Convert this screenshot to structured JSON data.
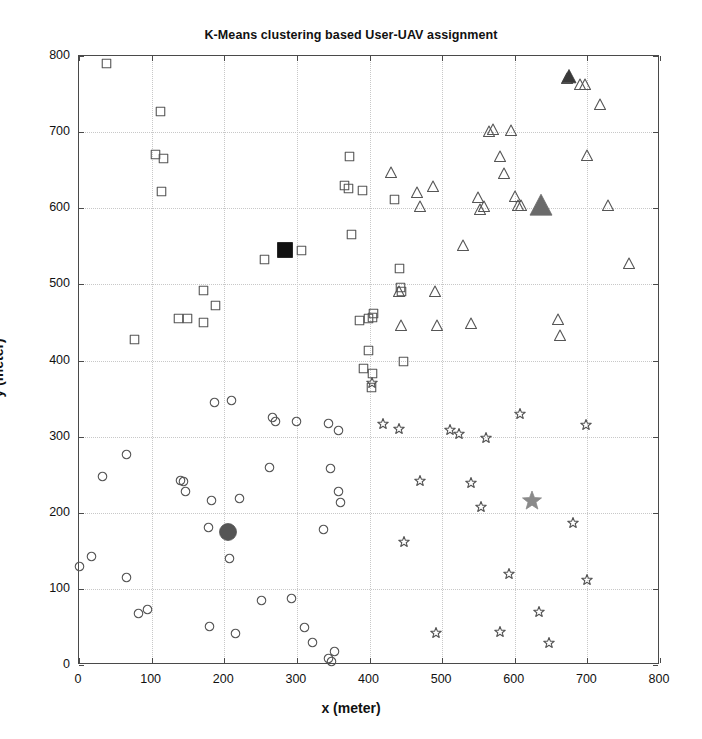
{
  "figure": {
    "title": "K-Means clustering based User-UAV assignment",
    "xlabel": "x (meter)",
    "ylabel": "y (meter)"
  },
  "colors": {
    "axis": "#4a4a4a",
    "grid": "#c8c8c8",
    "marker_outline": "#555555",
    "centroid_square": "#111111",
    "centroid_circle": "#555555",
    "centroid_triangle": "#6a6a6a",
    "centroid_star": "#8a8a8a",
    "centroid_triangle_dark": "#3a3a3a",
    "text": "#111111"
  },
  "chart_data": {
    "type": "scatter",
    "title": "K-Means clustering based User-UAV assignment",
    "xlabel": "x (meter)",
    "ylabel": "y (meter)",
    "xlim": [
      0,
      800
    ],
    "ylim": [
      0,
      800
    ],
    "xticks": [
      0,
      100,
      200,
      300,
      400,
      500,
      600,
      700,
      800
    ],
    "yticks": [
      0,
      100,
      200,
      300,
      400,
      500,
      600,
      700,
      800
    ],
    "grid": true,
    "legend": "none",
    "series": [
      {
        "name": "Cluster 1 users (square)",
        "marker": "square",
        "filled": false,
        "points": [
          [
            38,
            790
          ],
          [
            112,
            727
          ],
          [
            106,
            671
          ],
          [
            117,
            665
          ],
          [
            114,
            622
          ],
          [
            76,
            428
          ],
          [
            137,
            455
          ],
          [
            150,
            455
          ],
          [
            172,
            492
          ],
          [
            171,
            450
          ],
          [
            188,
            472
          ],
          [
            256,
            533
          ],
          [
            283,
            545
          ],
          [
            306,
            545
          ],
          [
            373,
            668
          ],
          [
            365,
            630
          ],
          [
            371,
            626
          ],
          [
            391,
            623
          ],
          [
            375,
            566
          ],
          [
            386,
            453
          ],
          [
            398,
            455
          ],
          [
            404,
            457
          ],
          [
            406,
            462
          ],
          [
            399,
            413
          ],
          [
            392,
            389
          ],
          [
            404,
            383
          ],
          [
            403,
            364
          ],
          [
            435,
            612
          ],
          [
            442,
            496
          ],
          [
            444,
            490
          ],
          [
            441,
            521
          ],
          [
            447,
            399
          ]
        ]
      },
      {
        "name": "Cluster 1 centroid (filled square)",
        "marker": "square",
        "filled": true,
        "size": 15,
        "points": [
          [
            283,
            545
          ]
        ]
      },
      {
        "name": "Cluster 2 users (circle)",
        "marker": "circle",
        "filled": false,
        "points": [
          [
            0,
            130
          ],
          [
            17,
            142
          ],
          [
            33,
            247
          ],
          [
            65,
            276
          ],
          [
            66,
            115
          ],
          [
            82,
            67
          ],
          [
            95,
            73
          ],
          [
            140,
            242
          ],
          [
            144,
            241
          ],
          [
            147,
            228
          ],
          [
            180,
            51
          ],
          [
            178,
            181
          ],
          [
            183,
            216
          ],
          [
            186,
            345
          ],
          [
            207,
            140
          ],
          [
            210,
            348
          ],
          [
            207,
            175
          ],
          [
            216,
            41
          ],
          [
            221,
            219
          ],
          [
            251,
            85
          ],
          [
            262,
            259
          ],
          [
            266,
            325
          ],
          [
            271,
            320
          ],
          [
            292,
            88
          ],
          [
            300,
            320
          ],
          [
            310,
            49
          ],
          [
            322,
            30
          ],
          [
            344,
            9
          ],
          [
            348,
            4
          ],
          [
            352,
            18
          ],
          [
            346,
            258
          ],
          [
            357,
            228
          ],
          [
            360,
            214
          ],
          [
            336,
            178
          ],
          [
            344,
            317
          ],
          [
            358,
            308
          ]
        ]
      },
      {
        "name": "Cluster 2 centroid (filled circle)",
        "marker": "circle",
        "filled": true,
        "size": 17,
        "points": [
          [
            205,
            175
          ]
        ]
      },
      {
        "name": "Cluster 3 users (triangle)",
        "marker": "triangle",
        "filled": false,
        "points": [
          [
            430,
            646
          ],
          [
            441,
            490
          ],
          [
            443,
            445
          ],
          [
            465,
            620
          ],
          [
            469,
            601
          ],
          [
            487,
            628
          ],
          [
            490,
            490
          ],
          [
            493,
            445
          ],
          [
            529,
            551
          ],
          [
            540,
            448
          ],
          [
            550,
            613
          ],
          [
            552,
            598
          ],
          [
            558,
            601
          ],
          [
            565,
            700
          ],
          [
            570,
            703
          ],
          [
            580,
            667
          ],
          [
            585,
            645
          ],
          [
            595,
            702
          ],
          [
            600,
            615
          ],
          [
            605,
            603
          ],
          [
            608,
            603
          ],
          [
            636,
            603
          ],
          [
            660,
            453
          ],
          [
            662,
            432
          ],
          [
            672,
            770
          ],
          [
            690,
            762
          ],
          [
            697,
            762
          ],
          [
            700,
            668
          ],
          [
            718,
            735
          ],
          [
            728,
            603
          ],
          [
            757,
            527
          ]
        ]
      },
      {
        "name": "Cluster 3 centroid (filled triangle)",
        "marker": "triangle",
        "filled": true,
        "size": 22,
        "points": [
          [
            636,
            603
          ]
        ]
      },
      {
        "name": "Cluster 3 secondary centroid (dark triangle)",
        "marker": "triangle",
        "filled": true,
        "size": 14,
        "points": [
          [
            675,
            772
          ]
        ]
      },
      {
        "name": "Cluster 4 users (star)",
        "marker": "star",
        "filled": false,
        "points": [
          [
            404,
            371
          ],
          [
            419,
            317
          ],
          [
            440,
            310
          ],
          [
            448,
            162
          ],
          [
            470,
            242
          ],
          [
            492,
            42
          ],
          [
            511,
            309
          ],
          [
            523,
            303
          ],
          [
            540,
            239
          ],
          [
            553,
            208
          ],
          [
            561,
            298
          ],
          [
            580,
            44
          ],
          [
            592,
            120
          ],
          [
            607,
            330
          ],
          [
            624,
            215
          ],
          [
            633,
            70
          ],
          [
            647,
            29
          ],
          [
            680,
            186
          ],
          [
            698,
            315
          ],
          [
            700,
            112
          ]
        ]
      },
      {
        "name": "Cluster 4 centroid (filled star)",
        "marker": "star",
        "filled": true,
        "size": 20,
        "points": [
          [
            624,
            215
          ]
        ]
      }
    ]
  }
}
